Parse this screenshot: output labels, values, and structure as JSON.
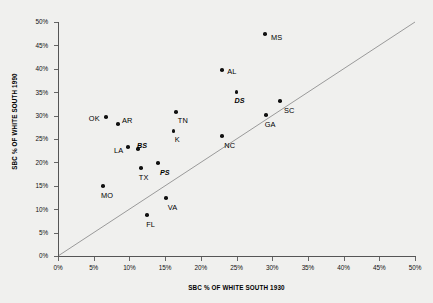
{
  "chart_data": {
    "type": "scatter",
    "title": "",
    "xlabel": "SBC % OF WHITE SOUTH 1930",
    "ylabel": "SBC % OF WHITE SOUTH 1990",
    "xlim": [
      0,
      50
    ],
    "ylim": [
      0,
      50
    ],
    "xtick_labels": [
      "0%",
      "5%",
      "10%",
      "15%",
      "20%",
      "25%",
      "30%",
      "35%",
      "40%",
      "45%",
      "50%"
    ],
    "ytick_labels": [
      "0%",
      "5%",
      "10%",
      "15%",
      "20%",
      "25%",
      "30%",
      "35%",
      "40%",
      "45%",
      "50%"
    ],
    "xticks": [
      0,
      5,
      10,
      15,
      20,
      25,
      30,
      35,
      40,
      45,
      50
    ],
    "yticks": [
      0,
      5,
      10,
      15,
      20,
      25,
      30,
      35,
      40,
      45,
      50
    ],
    "grid": false,
    "legend": "none",
    "reference_line": {
      "label": "y = x diagonal",
      "from": [
        0,
        0
      ],
      "to": [
        50,
        50
      ],
      "color": "#9a9a9a"
    },
    "points": [
      {
        "label": "MS",
        "x": 29.0,
        "y": 47.4,
        "bold": false,
        "lx": 6,
        "ly": 3
      },
      {
        "label": "AL",
        "x": 23.0,
        "y": 39.7,
        "bold": false,
        "lx": 5,
        "ly": 1
      },
      {
        "label": "DS",
        "x": 25.0,
        "y": 35.0,
        "bold": true,
        "lx": -2,
        "ly": 8
      },
      {
        "label": "SC",
        "x": 31.1,
        "y": 33.1,
        "bold": false,
        "lx": 4,
        "ly": 9
      },
      {
        "label": "GA",
        "x": 29.1,
        "y": 30.1,
        "bold": false,
        "lx": -1,
        "ly": 9
      },
      {
        "label": "TN",
        "x": 16.5,
        "y": 30.8,
        "bold": false,
        "lx": 2,
        "ly": 8
      },
      {
        "label": "OK",
        "x": 6.7,
        "y": 29.7,
        "bold": false,
        "lx": -17,
        "ly": 1
      },
      {
        "label": "AR",
        "x": 8.4,
        "y": 28.2,
        "bold": false,
        "lx": 4,
        "ly": -4
      },
      {
        "label": "K",
        "x": 16.2,
        "y": 26.7,
        "bold": false,
        "lx": 1,
        "ly": 8
      },
      {
        "label": "NC",
        "x": 23.0,
        "y": 25.6,
        "bold": false,
        "lx": 2,
        "ly": 9
      },
      {
        "label": "BS",
        "x": 11.2,
        "y": 22.9,
        "bold": true,
        "lx": -1,
        "ly": -4
      },
      {
        "label": "LA",
        "x": 9.8,
        "y": 23.3,
        "bold": false,
        "lx": -14,
        "ly": 3
      },
      {
        "label": "PS",
        "x": 14.0,
        "y": 19.9,
        "bold": true,
        "lx": 2,
        "ly": 9
      },
      {
        "label": "TX",
        "x": 11.6,
        "y": 18.8,
        "bold": false,
        "lx": -2,
        "ly": 9
      },
      {
        "label": "MO",
        "x": 6.3,
        "y": 15.0,
        "bold": false,
        "lx": -2,
        "ly": 9
      },
      {
        "label": "VA",
        "x": 15.1,
        "y": 12.4,
        "bold": false,
        "lx": 2,
        "ly": 9
      },
      {
        "label": "FL",
        "x": 12.5,
        "y": 8.8,
        "bold": false,
        "lx": -1,
        "ly": 9
      }
    ]
  },
  "colors": {
    "background": "#f0f0ee",
    "point": "#111111",
    "axis": "#555555",
    "reference_line": "#9a9a9a"
  }
}
